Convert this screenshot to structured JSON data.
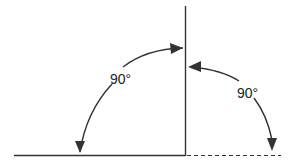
{
  "diagram": {
    "colors": {
      "line": "#333333",
      "background": "#ffffff"
    },
    "baseline": {
      "style": "solid",
      "label": ""
    },
    "extension": {
      "style": "dashed",
      "label": ""
    },
    "vertical": {
      "style": "solid",
      "label": ""
    },
    "angles": [
      {
        "id": "left-angle",
        "label": "90°",
        "degrees": 90,
        "from": "horizontal-left",
        "to": "vertical"
      },
      {
        "id": "right-angle",
        "label": "90°",
        "degrees": 90,
        "from": "vertical",
        "to": "horizontal-right-dashed"
      }
    ]
  }
}
